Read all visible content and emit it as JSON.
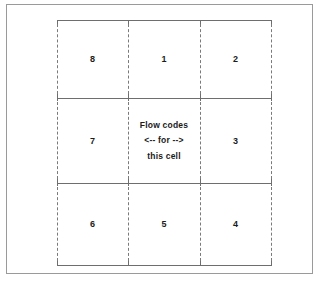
{
  "figure": {
    "colors": {
      "frame": "#9a9a9a",
      "grid_line": "#6e6e6e",
      "dashed_line": "#7a7a7a",
      "text": "#1b1b1b",
      "background": "#ffffff"
    },
    "grid": {
      "rows": [
        {
          "cells": [
            {
              "id": "cell-8",
              "label": "8"
            },
            {
              "id": "cell-1",
              "label": "1"
            },
            {
              "id": "cell-2",
              "label": "2"
            }
          ]
        },
        {
          "cells": [
            {
              "id": "cell-7",
              "label": "7"
            },
            {
              "id": "cell-center",
              "label": ""
            },
            {
              "id": "cell-3",
              "label": "3"
            }
          ]
        },
        {
          "cells": [
            {
              "id": "cell-6",
              "label": "6"
            },
            {
              "id": "cell-5",
              "label": "5"
            },
            {
              "id": "cell-4",
              "label": "4"
            }
          ]
        }
      ]
    },
    "center_cell": {
      "line1": "Flow codes",
      "line2": "<-- for -->",
      "line3": "this cell"
    }
  }
}
